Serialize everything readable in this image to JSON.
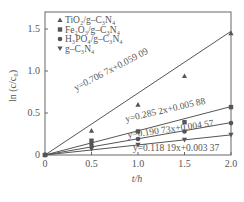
{
  "chart_data": {
    "type": "line",
    "title": "",
    "xlabel": "t/h",
    "ylabel": "ln (c/c0)",
    "xlim": [
      0,
      2.0
    ],
    "ylim": [
      0,
      1.7
    ],
    "xticks": [
      "0",
      "0.5",
      "1.0",
      "1.5",
      "2.0"
    ],
    "yticks": [
      "0",
      "0.5",
      "1.0",
      "1.5"
    ],
    "grid": false,
    "legend_position": "upper-left",
    "x": [
      0,
      0.5,
      1.0,
      1.5,
      2.0
    ],
    "series": [
      {
        "name": "TiO2/g-C3N4",
        "marker": "triangle-up",
        "values": [
          0,
          0.29,
          0.6,
          0.94,
          1.45
        ],
        "fit": "y=0.706 7x+0.059 09",
        "slope": 0.7067,
        "intercept": 0.05909
      },
      {
        "name": "Fe2O3/g-C3N4",
        "marker": "square",
        "values": [
          0,
          0.17,
          0.28,
          0.39,
          0.57
        ],
        "fit": "y=0.285 2x+0.005 88",
        "slope": 0.2852,
        "intercept": 0.00588
      },
      {
        "name": "H3PO4/g-C3N4",
        "marker": "circle",
        "values": [
          0,
          0.12,
          0.19,
          0.28,
          0.38
        ],
        "fit": "y=0.190 73x+0.004 57",
        "slope": 0.19073,
        "intercept": 0.00457
      },
      {
        "name": "g-C3N4",
        "marker": "triangle-down",
        "values": [
          0,
          0.07,
          0.12,
          0.18,
          0.24
        ],
        "fit": "y=0.118 19x+0.003 37",
        "slope": 0.11819,
        "intercept": 0.00337
      }
    ]
  },
  "labels": {
    "xlabel": "t/h",
    "ylabel": "ln (c/c₀)",
    "legend": [
      "TiO₂/g–C₃N₄",
      "Fe₂O₃/g–C₃N₄",
      "H₃PO₄/g–C₃N₄",
      "g–C₃N₄"
    ],
    "fits": [
      "y=0.706 7x+0.059 09",
      "y=0.285 2x+0.005 88",
      "y=0.190 73x+0.004 57",
      "y=0.118 19x+0.003 37"
    ]
  }
}
